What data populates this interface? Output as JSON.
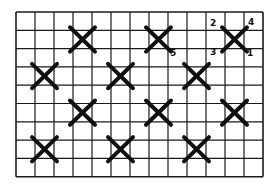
{
  "diagram": {
    "grid": {
      "columns": 13,
      "rows": 9,
      "left": 16,
      "top": 12,
      "cell_width": 19,
      "cell_height": 18.3,
      "line_color": "#1a1a1a",
      "background": "#ffffff"
    },
    "stitch_color": "#111111",
    "stitches": [
      {
        "row": 1,
        "col": 3
      },
      {
        "row": 1,
        "col": 7
      },
      {
        "row": 1,
        "col": 11
      },
      {
        "row": 3,
        "col": 1
      },
      {
        "row": 3,
        "col": 5
      },
      {
        "row": 3,
        "col": 9
      },
      {
        "row": 5,
        "col": 3
      },
      {
        "row": 5,
        "col": 7
      },
      {
        "row": 5,
        "col": 11
      },
      {
        "row": 7,
        "col": 1
      },
      {
        "row": 7,
        "col": 5
      },
      {
        "row": 7,
        "col": 9
      }
    ],
    "labels": [
      {
        "text": "2",
        "x": 210,
        "y": 19
      },
      {
        "text": "4",
        "x": 248,
        "y": 18
      },
      {
        "text": "3",
        "x": 210,
        "y": 48
      },
      {
        "text": "1",
        "x": 247,
        "y": 49
      },
      {
        "text": "5",
        "x": 170,
        "y": 49
      }
    ]
  }
}
